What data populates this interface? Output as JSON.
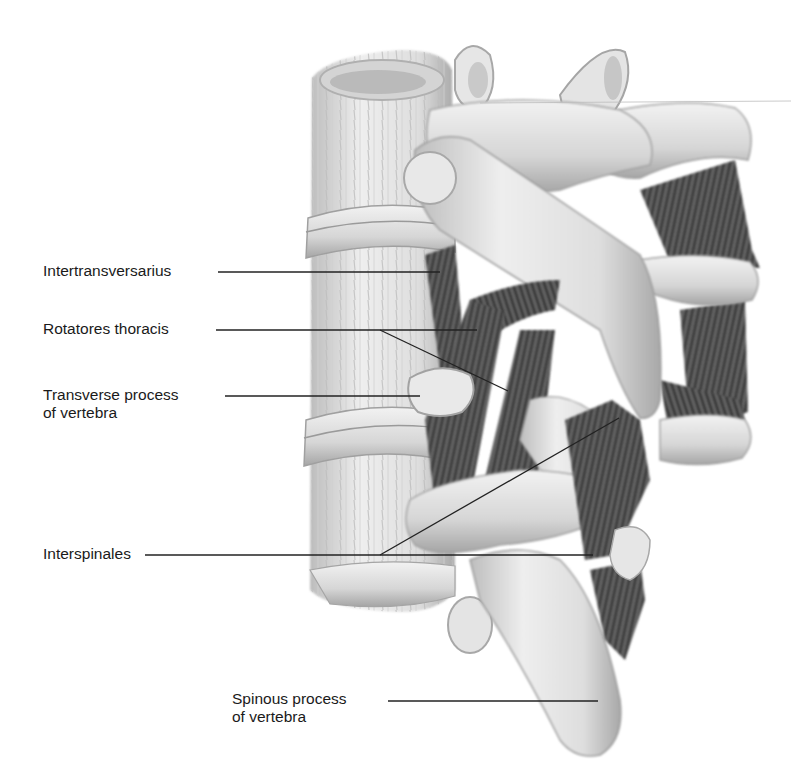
{
  "figure": {
    "background": "#ffffff",
    "colors": {
      "bone_light": "#ececec",
      "bone_mid": "#cfcfcf",
      "bone_shadow": "#9c9c9c",
      "muscle_dark": "#3e3e3e",
      "muscle_mid": "#6a6a6a",
      "leader_line": "#222222",
      "label_text": "#1a1a1a"
    }
  },
  "labels": [
    {
      "id": "intertransversarius",
      "text": "Intertransversarius",
      "x": 43,
      "y": 262,
      "lines": [
        [
          218,
          272,
          440,
          272
        ]
      ]
    },
    {
      "id": "rotatores-thoracis",
      "text": "Rotatores thoracis",
      "x": 43,
      "y": 320,
      "lines": [
        [
          216,
          330,
          477,
          330
        ],
        [
          380,
          330,
          508,
          391
        ]
      ]
    },
    {
      "id": "transverse-process",
      "text": "Transverse process\nof vertebra",
      "x": 43,
      "y": 386,
      "lines": [
        [
          225,
          396,
          420,
          396
        ]
      ]
    },
    {
      "id": "interspinales",
      "text": "Interspinales",
      "x": 43,
      "y": 545,
      "lines": [
        [
          145,
          555,
          593,
          555
        ],
        [
          380,
          555,
          619,
          418
        ]
      ]
    },
    {
      "id": "spinous-process",
      "text": "Spinous process\nof vertebra",
      "x": 232,
      "y": 690,
      "lines": [
        [
          388,
          701,
          598,
          701
        ]
      ]
    }
  ]
}
